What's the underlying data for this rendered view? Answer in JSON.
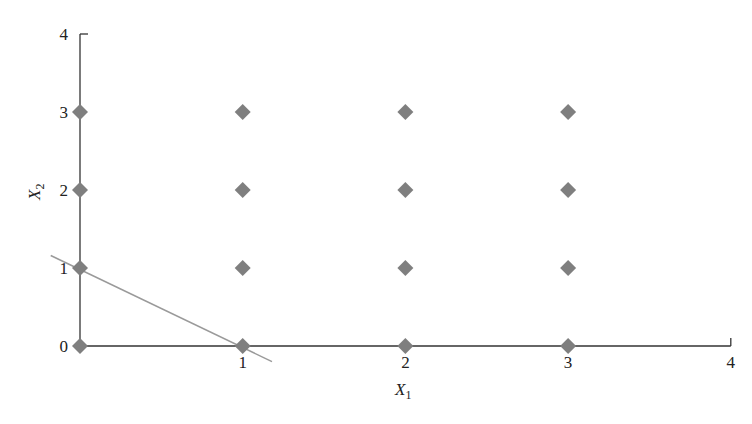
{
  "chart_data": {
    "type": "scatter",
    "title": "",
    "xlabel": "X1",
    "ylabel": "X2",
    "xlabel_main": "X",
    "xlabel_sub": "1",
    "ylabel_main": "X",
    "ylabel_sub": "2",
    "xlim": [
      0,
      4
    ],
    "ylim": [
      0,
      4
    ],
    "grid": false,
    "x_ticks": [
      "1",
      "2",
      "3",
      "4"
    ],
    "y_ticks": [
      "0",
      "1",
      "2",
      "3",
      "4"
    ],
    "series": [
      {
        "name": "integer lattice points",
        "marker": "diamond",
        "color": "#7f7f7f",
        "points": [
          [
            0,
            0
          ],
          [
            1,
            0
          ],
          [
            2,
            0
          ],
          [
            3,
            0
          ],
          [
            0,
            1
          ],
          [
            1,
            1
          ],
          [
            2,
            1
          ],
          [
            3,
            1
          ],
          [
            0,
            2
          ],
          [
            1,
            2
          ],
          [
            2,
            2
          ],
          [
            3,
            2
          ],
          [
            0,
            3
          ],
          [
            1,
            3
          ],
          [
            2,
            3
          ],
          [
            3,
            3
          ]
        ]
      }
    ],
    "lines": [
      {
        "name": "constraint line X1 + X2 = 1",
        "from": [
          -0.18,
          1.16
        ],
        "to": [
          1.18,
          -0.2
        ],
        "color": "#9a9a9a"
      }
    ]
  }
}
